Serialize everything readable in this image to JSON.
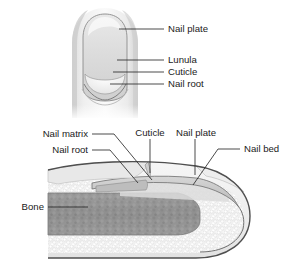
{
  "figure": {
    "background_color": "#ffffff",
    "text_color": "#1a1a1a",
    "leader_color": "#2b2b2b"
  },
  "top_view": {
    "name": "fingertip-top-view",
    "description": "Dorsal view of a fingertip showing the nail plate, lunula, cuticle and nail root",
    "labels": [
      {
        "id": "nail-plate",
        "text": "Nail plate",
        "x": 168,
        "y": 29,
        "leader": {
          "x1": 119,
          "y1": 29,
          "x2": 164,
          "y2": 29
        }
      },
      {
        "id": "lunula",
        "text": "Lunula",
        "x": 168,
        "y": 60,
        "leader": {
          "x1": 117,
          "y1": 60,
          "x2": 164,
          "y2": 60
        }
      },
      {
        "id": "cuticle",
        "text": "Cuticle",
        "x": 168,
        "y": 72,
        "leader": {
          "x1": 113,
          "y1": 72,
          "x2": 164,
          "y2": 72
        }
      },
      {
        "id": "nail-root",
        "text": "Nail root",
        "x": 168,
        "y": 84,
        "leader": {
          "x1": 110,
          "y1": 84,
          "x2": 164,
          "y2": 84
        }
      }
    ]
  },
  "cross_section": {
    "name": "fingertip-cross-section",
    "description": "Sagittal cross-section of a fingertip showing nail matrix, nail root, cuticle, nail plate, nail bed and bone",
    "labels": [
      {
        "id": "nail-matrix",
        "text": "Nail matrix",
        "x": 86,
        "y": 134,
        "anchor": "end",
        "leader": {
          "x1": 92,
          "y1": 134,
          "x2": 114,
          "y2": 134,
          "x3": 152,
          "y3": 180
        }
      },
      {
        "id": "nail-root",
        "text": "Nail root",
        "x": 86,
        "y": 150,
        "anchor": "end",
        "leader": {
          "x1": 92,
          "y1": 150,
          "x2": 110,
          "y2": 150,
          "x3": 138,
          "y3": 183
        }
      },
      {
        "id": "cuticle",
        "text": "Cuticle",
        "x": 150,
        "y": 133,
        "anchor": "middle",
        "leader": {
          "x1": 150,
          "y1": 139,
          "x2": 150,
          "y2": 173
        }
      },
      {
        "id": "nail-plate",
        "text": "Nail plate",
        "x": 195,
        "y": 133,
        "anchor": "middle",
        "leader": {
          "x1": 195,
          "y1": 139,
          "x2": 195,
          "y2": 175
        }
      },
      {
        "id": "nail-bed",
        "text": "Nail bed",
        "x": 244,
        "y": 149,
        "anchor": "start",
        "leader": {
          "x1": 240,
          "y1": 149,
          "x2": 218,
          "y2": 149,
          "x3": 193,
          "y3": 185
        }
      },
      {
        "id": "bone",
        "text": "Bone",
        "x": 42,
        "y": 207,
        "anchor": "end",
        "leader": {
          "x1": 48,
          "y1": 207,
          "x2": 88,
          "y2": 207
        }
      }
    ]
  },
  "colors": {
    "skin_light": "#f2f2f2",
    "skin_mid": "#d8d8d8",
    "skin_shadow": "#bdbdbd",
    "nail_plate": "#cfcfcf",
    "nail_outline": "#6e6e6e",
    "tissue": "#ededed",
    "bone": "#9a9a9a",
    "outline_dark": "#555555"
  }
}
